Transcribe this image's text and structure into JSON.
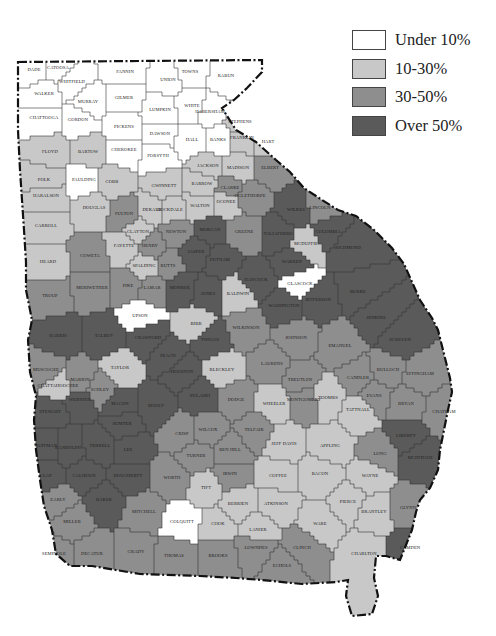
{
  "map": {
    "region": "Georgia counties",
    "legend": [
      {
        "key": "under10",
        "label": "Under 10%",
        "color": "#ffffff"
      },
      {
        "key": "10to30",
        "label": "10-30%",
        "color": "#c8c8c8"
      },
      {
        "key": "30to50",
        "label": "30-50%",
        "color": "#8e8e8e"
      },
      {
        "key": "over50",
        "label": "Over 50%",
        "color": "#5a5a5a"
      }
    ],
    "counties": [
      {
        "name": "DADE",
        "cat": "under10"
      },
      {
        "name": "CATOOSA",
        "cat": "under10"
      },
      {
        "name": "WHITFIELD",
        "cat": "under10"
      },
      {
        "name": "WALKER",
        "cat": "under10"
      },
      {
        "name": "MURRAY",
        "cat": "under10"
      },
      {
        "name": "FANNIN",
        "cat": "under10"
      },
      {
        "name": "UNION",
        "cat": "under10"
      },
      {
        "name": "TOWNS",
        "cat": "under10"
      },
      {
        "name": "RABUN",
        "cat": "under10"
      },
      {
        "name": "GILMER",
        "cat": "under10"
      },
      {
        "name": "CHATTOOGA",
        "cat": "under10"
      },
      {
        "name": "GORDON",
        "cat": "under10"
      },
      {
        "name": "LUMPKIN",
        "cat": "under10"
      },
      {
        "name": "WHITE",
        "cat": "under10"
      },
      {
        "name": "HABERSHAM",
        "cat": "under10"
      },
      {
        "name": "PICKENS",
        "cat": "under10"
      },
      {
        "name": "DAWSON",
        "cat": "under10"
      },
      {
        "name": "STEPHENS",
        "cat": "10to30"
      },
      {
        "name": "FLOYD",
        "cat": "10to30"
      },
      {
        "name": "BARTOW",
        "cat": "10to30"
      },
      {
        "name": "CHEROKEE",
        "cat": "under10"
      },
      {
        "name": "FORSYTH",
        "cat": "under10"
      },
      {
        "name": "HALL",
        "cat": "under10"
      },
      {
        "name": "BANKS",
        "cat": "under10"
      },
      {
        "name": "FRANKLIN",
        "cat": "10to30"
      },
      {
        "name": "HART",
        "cat": "10to30"
      },
      {
        "name": "JACKSON",
        "cat": "10to30"
      },
      {
        "name": "MADISON",
        "cat": "10to30"
      },
      {
        "name": "ELBERT",
        "cat": "30to50"
      },
      {
        "name": "POLK",
        "cat": "10to30"
      },
      {
        "name": "PAULDING",
        "cat": "under10"
      },
      {
        "name": "COBB",
        "cat": "10to30"
      },
      {
        "name": "GWINNETT",
        "cat": "10to30"
      },
      {
        "name": "BARROW",
        "cat": "10to30"
      },
      {
        "name": "CLARKE",
        "cat": "30to50"
      },
      {
        "name": "OGLETHORPE",
        "cat": "30to50"
      },
      {
        "name": "HARALSON",
        "cat": "10to30"
      },
      {
        "name": "DOUGLAS",
        "cat": "10to30"
      },
      {
        "name": "FULTON",
        "cat": "30to50"
      },
      {
        "name": "DEKALB",
        "cat": "10to30"
      },
      {
        "name": "ROCKDALE",
        "cat": "10to30"
      },
      {
        "name": "WALTON",
        "cat": "10to30"
      },
      {
        "name": "OCONEE",
        "cat": "10to30"
      },
      {
        "name": "WILKES",
        "cat": "over50"
      },
      {
        "name": "LINCOLN",
        "cat": "30to50"
      },
      {
        "name": "CARROLL",
        "cat": "10to30"
      },
      {
        "name": "CLAYTON",
        "cat": "10to30"
      },
      {
        "name": "NEWTON",
        "cat": "30to50"
      },
      {
        "name": "MORGAN",
        "cat": "over50"
      },
      {
        "name": "GREENE",
        "cat": "30to50"
      },
      {
        "name": "TALIAFERRO",
        "cat": "over50"
      },
      {
        "name": "MCDUFFIE",
        "cat": "10to30"
      },
      {
        "name": "COLUMBIA",
        "cat": "over50"
      },
      {
        "name": "HEARD",
        "cat": "10to30"
      },
      {
        "name": "COWETA",
        "cat": "30to50"
      },
      {
        "name": "FAYETTE",
        "cat": "10to30"
      },
      {
        "name": "HENRY",
        "cat": "30to50"
      },
      {
        "name": "SPALDING",
        "cat": "10to30"
      },
      {
        "name": "BUTTS",
        "cat": "30to50"
      },
      {
        "name": "JASPER",
        "cat": "over50"
      },
      {
        "name": "PUTNAM",
        "cat": "over50"
      },
      {
        "name": "HANCOCK",
        "cat": "over50"
      },
      {
        "name": "WARREN",
        "cat": "over50"
      },
      {
        "name": "GLASCOCK",
        "cat": "under10"
      },
      {
        "name": "RICHMOND",
        "cat": "over50"
      },
      {
        "name": "TROUP",
        "cat": "30to50"
      },
      {
        "name": "MERIWETHER",
        "cat": "30to50"
      },
      {
        "name": "PIKE",
        "cat": "30to50"
      },
      {
        "name": "LAMAR",
        "cat": "30to50"
      },
      {
        "name": "MONROE",
        "cat": "over50"
      },
      {
        "name": "JONES",
        "cat": "over50"
      },
      {
        "name": "BALDWIN",
        "cat": "10to30"
      },
      {
        "name": "WASHINGTON",
        "cat": "over50"
      },
      {
        "name": "JEFFERSON",
        "cat": "over50"
      },
      {
        "name": "BURKE",
        "cat": "over50"
      },
      {
        "name": "UPSON",
        "cat": "under10"
      },
      {
        "name": "HARRIS",
        "cat": "over50"
      },
      {
        "name": "TALBOT",
        "cat": "over50"
      },
      {
        "name": "CRAWFORD",
        "cat": "over50"
      },
      {
        "name": "BIBB",
        "cat": "10to30"
      },
      {
        "name": "TWIGGS",
        "cat": "over50"
      },
      {
        "name": "WILKINSON",
        "cat": "30to50"
      },
      {
        "name": "JOHNSON",
        "cat": "30to50"
      },
      {
        "name": "EMANUEL",
        "cat": "30to50"
      },
      {
        "name": "JENKINS",
        "cat": "over50"
      },
      {
        "name": "SCREVEN",
        "cat": "over50"
      },
      {
        "name": "MUSCOGEE",
        "cat": "30to50"
      },
      {
        "name": "CHATTAHOOCHEE",
        "cat": "10to30"
      },
      {
        "name": "MARION",
        "cat": "30to50"
      },
      {
        "name": "TAYLOR",
        "cat": "10to30"
      },
      {
        "name": "PEACH",
        "cat": "over50"
      },
      {
        "name": "HOUSTON",
        "cat": "over50"
      },
      {
        "name": "BLECKLEY",
        "cat": "10to30"
      },
      {
        "name": "LAURENS",
        "cat": "30to50"
      },
      {
        "name": "TREUTLEN",
        "cat": "30to50"
      },
      {
        "name": "CANDLER",
        "cat": "30to50"
      },
      {
        "name": "BULLOCH",
        "cat": "30to50"
      },
      {
        "name": "EFFINGHAM",
        "cat": "30to50"
      },
      {
        "name": "STEWART",
        "cat": "over50"
      },
      {
        "name": "WEBSTER",
        "cat": "over50"
      },
      {
        "name": "SCHLEY",
        "cat": "30to50"
      },
      {
        "name": "MACON",
        "cat": "over50"
      },
      {
        "name": "SUMTER",
        "cat": "over50"
      },
      {
        "name": "DOOLY",
        "cat": "over50"
      },
      {
        "name": "PULASKI",
        "cat": "over50"
      },
      {
        "name": "DODGE",
        "cat": "30to50"
      },
      {
        "name": "WHEELER",
        "cat": "10to30"
      },
      {
        "name": "MONTGOMERY",
        "cat": "30to50"
      },
      {
        "name": "TOOMBS",
        "cat": "10to30"
      },
      {
        "name": "TATTNALL",
        "cat": "10to30"
      },
      {
        "name": "EVANS",
        "cat": "30to50"
      },
      {
        "name": "BRYAN",
        "cat": "30to50"
      },
      {
        "name": "CHATHAM",
        "cat": "30to50"
      },
      {
        "name": "QUITMAN",
        "cat": "over50"
      },
      {
        "name": "RANDOLPH",
        "cat": "over50"
      },
      {
        "name": "TERRELL",
        "cat": "over50"
      },
      {
        "name": "LEE",
        "cat": "over50"
      },
      {
        "name": "CRISP",
        "cat": "30to50"
      },
      {
        "name": "WILCOX",
        "cat": "30to50"
      },
      {
        "name": "TELFAIR",
        "cat": "30to50"
      },
      {
        "name": "JEFF DAVIS",
        "cat": "10to30"
      },
      {
        "name": "APPLING",
        "cat": "10to30"
      },
      {
        "name": "LIBERTY",
        "cat": "over50"
      },
      {
        "name": "LONG",
        "cat": "30to50"
      },
      {
        "name": "MCINTOSH",
        "cat": "over50"
      },
      {
        "name": "CLAY",
        "cat": "over50"
      },
      {
        "name": "CALHOUN",
        "cat": "over50"
      },
      {
        "name": "DOUGHERTY",
        "cat": "over50"
      },
      {
        "name": "WORTH",
        "cat": "30to50"
      },
      {
        "name": "TURNER",
        "cat": "30to50"
      },
      {
        "name": "BEN HILL",
        "cat": "30to50"
      },
      {
        "name": "IRWIN",
        "cat": "30to50"
      },
      {
        "name": "COFFEE",
        "cat": "10to30"
      },
      {
        "name": "BACON",
        "cat": "10to30"
      },
      {
        "name": "WAYNE",
        "cat": "10to30"
      },
      {
        "name": "EARLY",
        "cat": "30to50"
      },
      {
        "name": "BAKER",
        "cat": "over50"
      },
      {
        "name": "MITCHELL",
        "cat": "30to50"
      },
      {
        "name": "TIFT",
        "cat": "10to30"
      },
      {
        "name": "BERRIEN",
        "cat": "10to30"
      },
      {
        "name": "ATKINSON",
        "cat": "10to30"
      },
      {
        "name": "PIERCE",
        "cat": "10to30"
      },
      {
        "name": "BRANTLEY",
        "cat": "10to30"
      },
      {
        "name": "GLYNN",
        "cat": "30to50"
      },
      {
        "name": "MILLER",
        "cat": "30to50"
      },
      {
        "name": "COLQUITT",
        "cat": "under10"
      },
      {
        "name": "COOK",
        "cat": "10to30"
      },
      {
        "name": "WARE",
        "cat": "10to30"
      },
      {
        "name": "CAMDEN",
        "cat": "over50"
      },
      {
        "name": "SEMINOLE",
        "cat": "30to50"
      },
      {
        "name": "DECATUR",
        "cat": "30to50"
      },
      {
        "name": "GRADY",
        "cat": "30to50"
      },
      {
        "name": "THOMAS",
        "cat": "30to50"
      },
      {
        "name": "BROOKS",
        "cat": "30to50"
      },
      {
        "name": "LOWNDES",
        "cat": "30to50"
      },
      {
        "name": "LANIER",
        "cat": "10to30"
      },
      {
        "name": "CLINCH",
        "cat": "30to50"
      },
      {
        "name": "ECHOLS",
        "cat": "30to50"
      },
      {
        "name": "CHARLTON",
        "cat": "10to30"
      }
    ]
  }
}
